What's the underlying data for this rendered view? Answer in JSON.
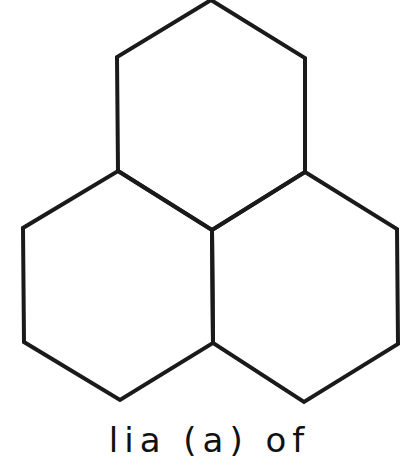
{
  "figure": {
    "stroke_color": "#1a1a1a",
    "stroke_width": 4,
    "background": "#ffffff",
    "hexagons": [
      {
        "name": "top-hexagon",
        "points": "211,0 305,58 305,172 212,230 118,171 117,57"
      },
      {
        "name": "bottom-left-hexagon",
        "points": "118,171 212,230 213,343 120,400 24,342 23,228"
      },
      {
        "name": "bottom-right-hexagon",
        "points": "305,172 397,229 398,344 304,402 213,343 212,230"
      }
    ]
  },
  "caption": {
    "text": "lia (a) of"
  }
}
